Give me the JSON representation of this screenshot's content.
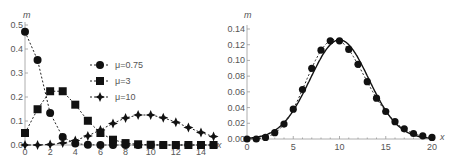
{
  "chart_data": [
    {
      "type": "line",
      "title": "",
      "xlabel": "x",
      "ylabel": "m",
      "xlim": [
        0,
        15
      ],
      "ylim": [
        0,
        0.5
      ],
      "x_ticks": [
        "0",
        "2",
        "4",
        "6",
        "8",
        "10",
        "12",
        "14"
      ],
      "y_ticks": [
        "0.0",
        "0.1",
        "0.2",
        "0.3",
        "0.4",
        "0.5"
      ],
      "grid": false,
      "legend_position": "center",
      "x": [
        0,
        1,
        2,
        3,
        4,
        5,
        6,
        7,
        8,
        9,
        10,
        11,
        12,
        13,
        14,
        15
      ],
      "series": [
        {
          "name": "μ=0.75",
          "marker": "circle",
          "values": [
            0.472,
            0.354,
            0.133,
            0.033,
            0.006,
            0.001,
            0,
            0,
            0,
            0,
            0,
            0,
            0,
            0,
            0,
            0
          ]
        },
        {
          "name": "μ=3",
          "marker": "square",
          "values": [
            0.05,
            0.149,
            0.224,
            0.224,
            0.168,
            0.101,
            0.05,
            0.022,
            0.008,
            0.003,
            0.001,
            0,
            0,
            0,
            0,
            0
          ]
        },
        {
          "name": "μ=10",
          "marker": "star",
          "values": [
            0.0,
            0.0,
            0.002,
            0.008,
            0.019,
            0.038,
            0.063,
            0.09,
            0.113,
            0.125,
            0.125,
            0.114,
            0.095,
            0.073,
            0.052,
            0.035
          ]
        }
      ]
    },
    {
      "type": "line",
      "title": "",
      "xlabel": "x",
      "ylabel": "m",
      "xlim": [
        0,
        20
      ],
      "ylim": [
        0,
        0.14
      ],
      "x_ticks": [
        "0",
        "5",
        "10",
        "15",
        "20"
      ],
      "y_ticks": [
        "0.00",
        "0.02",
        "0.04",
        "0.06",
        "0.08",
        "0.10",
        "0.12",
        "0.14"
      ],
      "grid": false,
      "x": [
        0,
        1,
        2,
        3,
        4,
        5,
        6,
        7,
        8,
        9,
        10,
        11,
        12,
        13,
        14,
        15,
        16,
        17,
        18,
        19,
        20
      ],
      "series": [
        {
          "name": "Poisson μ=10 (points, dashed)",
          "marker": "circle",
          "values": [
            0.0,
            0.0,
            0.002,
            0.008,
            0.019,
            0.038,
            0.063,
            0.09,
            0.113,
            0.125,
            0.125,
            0.114,
            0.095,
            0.073,
            0.052,
            0.035,
            0.022,
            0.013,
            0.007,
            0.004,
            0.002
          ]
        },
        {
          "name": "Normal approximation (solid)",
          "marker": "none",
          "mean": 10,
          "sd": 3.162
        }
      ]
    }
  ],
  "left": {
    "ylabel": "m",
    "xlabel": "x",
    "legend": [
      "μ=0.75",
      "μ=3",
      "μ=10"
    ]
  },
  "right": {
    "ylabel": "m",
    "xlabel": "x"
  }
}
